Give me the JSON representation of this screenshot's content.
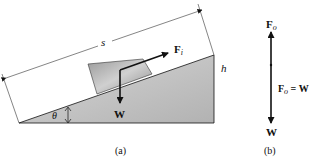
{
  "figure": {
    "panel_a": {
      "caption": "(a)",
      "length_label": "s",
      "height_label": "h",
      "angle_label": "θ",
      "force_label_main": "F",
      "force_label_sub": "i",
      "weight_label": "W"
    },
    "panel_b": {
      "caption": "(b)",
      "top_force_main": "F",
      "top_force_sub": "o",
      "equation_main": "F",
      "equation_sub": "o",
      "equation_rest": " = W",
      "bottom_label": "W"
    },
    "colors": {
      "incline_fill": "#c8c8c8",
      "block_fill": "#a8a8a8",
      "line": "#111111"
    }
  }
}
